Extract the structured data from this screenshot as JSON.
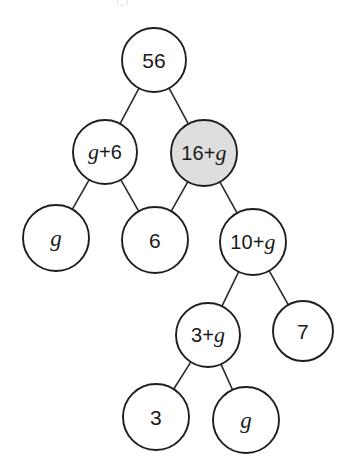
{
  "diagram": {
    "type": "binary-expression-tree",
    "canvas": {
      "width": 352,
      "height": 474
    },
    "colors": {
      "background": "#ffffff",
      "node_fill_default": "#ffffff",
      "node_fill_highlight": "#dedede",
      "node_stroke": "#1e1e1e",
      "edge_stroke": "#2b2b2b",
      "text": "#1a1a1a"
    },
    "nodes": [
      {
        "id": "n1",
        "label": "56",
        "parts": [
          {
            "t": "56",
            "k": "num"
          }
        ],
        "cx": 154,
        "cy": 60,
        "r": 32,
        "highlighted": false,
        "level": 0
      },
      {
        "id": "n2",
        "label": "g+6",
        "parts": [
          {
            "t": "g",
            "k": "var"
          },
          {
            "t": "+6",
            "k": "num"
          }
        ],
        "cx": 105,
        "cy": 152,
        "r": 32,
        "highlighted": false,
        "level": 1
      },
      {
        "id": "n3",
        "label": "16+g",
        "parts": [
          {
            "t": "16+",
            "k": "num"
          },
          {
            "t": "g",
            "k": "var"
          }
        ],
        "cx": 204,
        "cy": 153,
        "r": 33,
        "highlighted": true,
        "level": 1
      },
      {
        "id": "n4",
        "label": "g",
        "parts": [
          {
            "t": "g",
            "k": "var"
          }
        ],
        "cx": 56,
        "cy": 238,
        "r": 33,
        "highlighted": false,
        "level": 2
      },
      {
        "id": "n5",
        "label": "6",
        "parts": [
          {
            "t": "6",
            "k": "num"
          }
        ],
        "cx": 155,
        "cy": 240,
        "r": 33,
        "highlighted": false,
        "level": 2
      },
      {
        "id": "n6",
        "label": "10+g",
        "parts": [
          {
            "t": "10+",
            "k": "num"
          },
          {
            "t": "g",
            "k": "var"
          }
        ],
        "cx": 253,
        "cy": 242,
        "r": 33,
        "highlighted": false,
        "level": 2
      },
      {
        "id": "n7",
        "label": "3+g",
        "parts": [
          {
            "t": "3+",
            "k": "num"
          },
          {
            "t": "g",
            "k": "var"
          }
        ],
        "cx": 208,
        "cy": 335,
        "r": 32,
        "highlighted": false,
        "level": 3
      },
      {
        "id": "n8",
        "label": "7",
        "parts": [
          {
            "t": "7",
            "k": "num"
          }
        ],
        "cx": 303,
        "cy": 331,
        "r": 30,
        "highlighted": false,
        "level": 3
      },
      {
        "id": "n9",
        "label": "3",
        "parts": [
          {
            "t": "3",
            "k": "num"
          }
        ],
        "cx": 156,
        "cy": 417,
        "r": 33,
        "highlighted": false,
        "level": 4
      },
      {
        "id": "n10",
        "label": "g",
        "parts": [
          {
            "t": "g",
            "k": "var"
          }
        ],
        "cx": 246,
        "cy": 420,
        "r": 33,
        "highlighted": false,
        "level": 4
      }
    ],
    "edges": [
      {
        "from": "n1",
        "to": "n2"
      },
      {
        "from": "n1",
        "to": "n3"
      },
      {
        "from": "n2",
        "to": "n4"
      },
      {
        "from": "n2",
        "to": "n5"
      },
      {
        "from": "n3",
        "to": "n5"
      },
      {
        "from": "n3",
        "to": "n6"
      },
      {
        "from": "n6",
        "to": "n7"
      },
      {
        "from": "n6",
        "to": "n8"
      },
      {
        "from": "n7",
        "to": "n9"
      },
      {
        "from": "n7",
        "to": "n10"
      }
    ]
  }
}
